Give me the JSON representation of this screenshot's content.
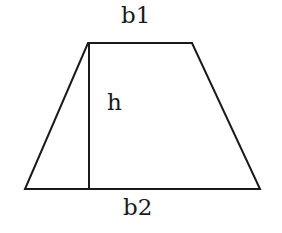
{
  "diagram": {
    "shape": "trapezoid",
    "labels": {
      "top_base": "b1",
      "height": "h",
      "bottom_base": "b2"
    },
    "vertices": {
      "top_left": [
        88,
        43
      ],
      "top_right": [
        192,
        43
      ],
      "bottom_right": [
        260,
        189
      ],
      "bottom_left": [
        25,
        189
      ]
    },
    "height_line": {
      "x": 89,
      "y_top": 43,
      "y_bottom": 189
    },
    "colors": {
      "stroke": "#1a1a1a",
      "background": "#ffffff"
    }
  }
}
